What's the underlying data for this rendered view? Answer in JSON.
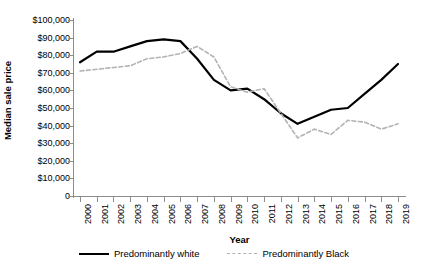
{
  "chart_data": {
    "type": "line",
    "title": "",
    "xlabel": "Year",
    "ylabel": "Median sale price",
    "x": [
      2000,
      2001,
      2002,
      2003,
      2004,
      2005,
      2006,
      2007,
      2008,
      2009,
      2010,
      2011,
      2012,
      2013,
      2014,
      2015,
      2016,
      2017,
      2018,
      2019
    ],
    "xtick_labels": [
      "2000",
      "2001",
      "2002",
      "2003",
      "2004",
      "2005",
      "2006",
      "2007",
      "2008",
      "2009",
      "2010",
      "2011",
      "2012",
      "2013",
      "2014",
      "2015",
      "2016",
      "2017",
      "2018",
      "2019"
    ],
    "ytick_labels": [
      "$100,000",
      "$90,000",
      "$80,000",
      "$70,000",
      "$60,000",
      "$50,000",
      "$40,000",
      "$30,000",
      "$20,000",
      "$10,000",
      "0"
    ],
    "ytick_values": [
      100000,
      90000,
      80000,
      70000,
      60000,
      50000,
      40000,
      30000,
      20000,
      10000,
      0
    ],
    "ylim": [
      0,
      100000
    ],
    "xlim": [
      2000,
      2019
    ],
    "grid": false,
    "legend_position": "bottom",
    "series": [
      {
        "name": "Predominantly white",
        "style": "solid",
        "color": "#000000",
        "values": [
          76000,
          82000,
          82000,
          85000,
          88000,
          89000,
          88000,
          78000,
          66000,
          60000,
          61000,
          55000,
          47000,
          41000,
          45000,
          49000,
          50000,
          58000,
          66000,
          75000
        ]
      },
      {
        "name": "Predominantly Black",
        "style": "dashed",
        "color": "#b3b3b3",
        "values": [
          71000,
          72000,
          73000,
          74000,
          78000,
          79000,
          81000,
          85000,
          79000,
          62000,
          59000,
          61000,
          47000,
          33000,
          38000,
          35000,
          43000,
          42000,
          38000,
          41000
        ]
      }
    ]
  }
}
